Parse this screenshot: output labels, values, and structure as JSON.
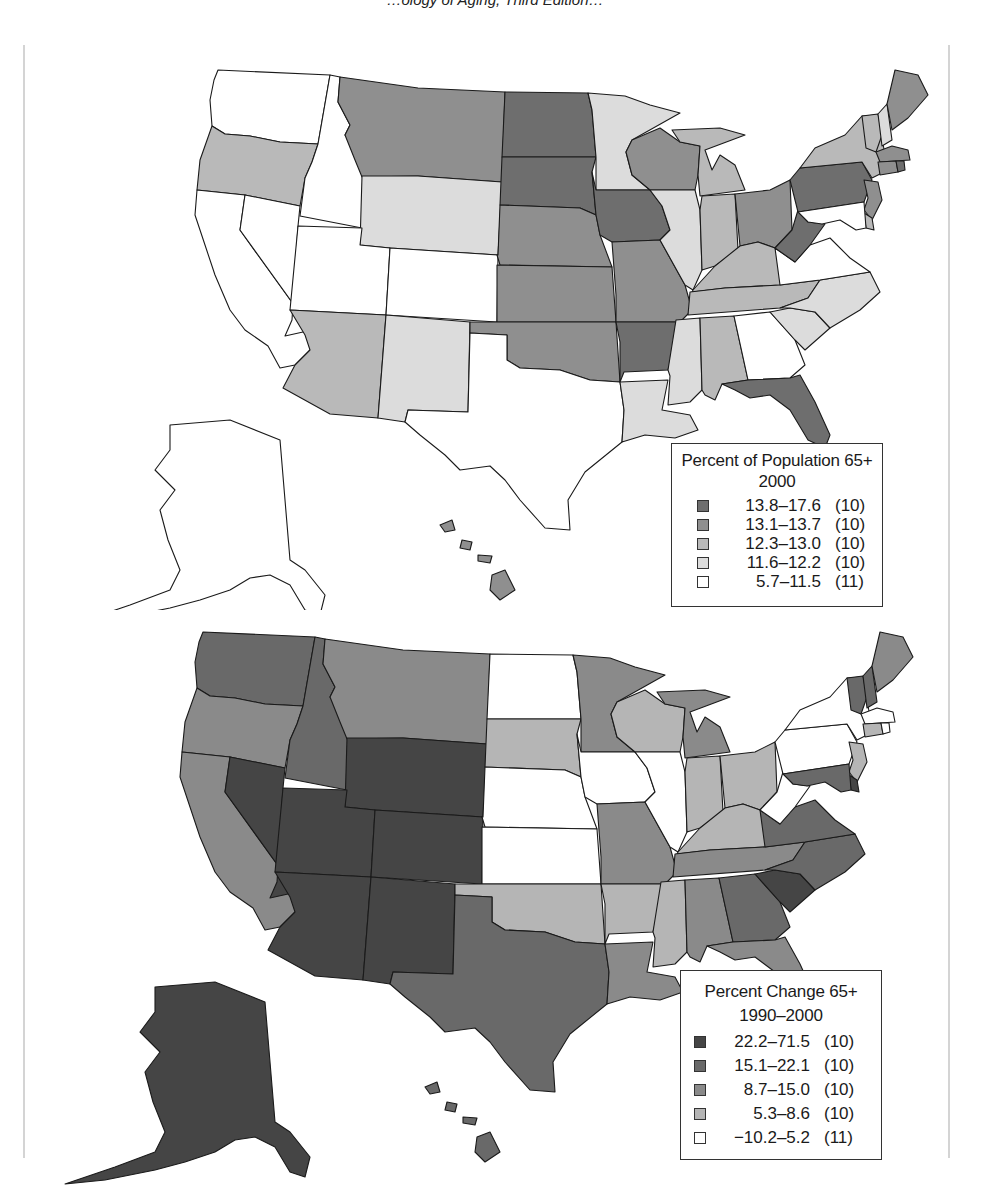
{
  "page": {
    "top_text_cut": "…ology of Aging, Third Edition…"
  },
  "colors": {
    "level1": "#ffffff",
    "level2": "#dcdcdc",
    "level3": "#b9b9b9",
    "level4": "#8f8f8f",
    "level5": "#6e6e6e",
    "dark5": "#454545",
    "dark4": "#696969",
    "dark3": "#8a8a8a",
    "dark2": "#b5b5b5",
    "dark1": "#ffffff"
  },
  "chart_data": [
    {
      "type": "choropleth",
      "title": "Percent of Population 65+",
      "subtitle": "2000",
      "legend_position": "bottom-right",
      "classes": [
        {
          "range": "13.8–17.6",
          "count": "(10)",
          "level": 5
        },
        {
          "range": "13.1–13.7",
          "count": "(10)",
          "level": 4
        },
        {
          "range": "12.3–13.0",
          "count": "(10)",
          "level": 3
        },
        {
          "range": "11.6–12.2",
          "count": "(10)",
          "level": 2
        },
        {
          "range": "5.7–11.5",
          "count": "(11)",
          "level": 1
        }
      ],
      "states": {
        "WA": 1,
        "OR": 3,
        "CA": 1,
        "NV": 1,
        "ID": 1,
        "MT": 4,
        "WY": 2,
        "UT": 1,
        "CO": 1,
        "AZ": 3,
        "NM": 2,
        "ND": 5,
        "SD": 5,
        "NE": 4,
        "KS": 4,
        "OK": 4,
        "TX": 1,
        "MN": 2,
        "IA": 5,
        "MO": 4,
        "AR": 5,
        "LA": 2,
        "WI": 4,
        "IL": 2,
        "MI": 3,
        "IN": 3,
        "OH": 4,
        "KY": 3,
        "TN": 3,
        "MS": 2,
        "AL": 3,
        "GA": 1,
        "FL": 5,
        "SC": 2,
        "NC": 2,
        "VA": 1,
        "WV": 5,
        "PA": 5,
        "NY": 3,
        "VT": 3,
        "NH": 2,
        "ME": 4,
        "MA": 4,
        "RI": 5,
        "CT": 4,
        "NJ": 4,
        "DE": 3,
        "MD": 1,
        "AK": 1,
        "HI": 4
      }
    },
    {
      "type": "choropleth",
      "title": "Percent Change 65+",
      "subtitle": "1990–2000",
      "legend_position": "bottom-right",
      "classes": [
        {
          "range": "22.2–71.5",
          "count": "(10)",
          "level": 5
        },
        {
          "range": "15.1–22.1",
          "count": "(10)",
          "level": 4
        },
        {
          "range": "8.7–15.0",
          "count": "(10)",
          "level": 3
        },
        {
          "range": "5.3–8.6",
          "count": "(10)",
          "level": 2
        },
        {
          "range": "−10.2–5.2",
          "count": "(11)",
          "level": 1
        }
      ],
      "states": {
        "WA": 4,
        "OR": 3,
        "CA": 3,
        "NV": 5,
        "ID": 4,
        "MT": 3,
        "WY": 5,
        "UT": 5,
        "CO": 5,
        "AZ": 5,
        "NM": 5,
        "ND": 1,
        "SD": 2,
        "NE": 1,
        "KS": 1,
        "OK": 2,
        "TX": 4,
        "MN": 3,
        "IA": 1,
        "MO": 3,
        "AR": 2,
        "LA": 3,
        "WI": 2,
        "IL": 1,
        "MI": 3,
        "IN": 2,
        "OH": 2,
        "KY": 2,
        "TN": 3,
        "MS": 2,
        "AL": 3,
        "GA": 4,
        "FL": 3,
        "SC": 5,
        "NC": 4,
        "VA": 4,
        "WV": 1,
        "PA": 1,
        "NY": 1,
        "VT": 4,
        "NH": 4,
        "ME": 3,
        "MA": 1,
        "RI": 1,
        "CT": 2,
        "NJ": 2,
        "DE": 5,
        "MD": 4,
        "AK": 5,
        "HI": 4
      }
    }
  ]
}
